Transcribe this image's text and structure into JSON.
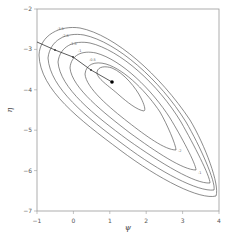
{
  "chart_data": {
    "type": "contour",
    "title": "",
    "xlabel": "ψ",
    "ylabel": "η",
    "xlim": [
      -1,
      4
    ],
    "ylim": [
      -7,
      -2
    ],
    "xticks": [
      -1,
      0,
      1,
      2,
      3,
      4
    ],
    "yticks": [
      -2,
      -3,
      -4,
      -5,
      -6,
      -7
    ],
    "grid": false,
    "legend": null,
    "contour_levels": [
      -3.5,
      -2.5,
      -1.5,
      -1,
      -0.5
    ],
    "contour_center": {
      "psi": 1.05,
      "eta": -3.9
    },
    "maximum_point": {
      "psi": 1.05,
      "eta": -3.9
    },
    "path_line": {
      "description": "curve from left axis to the maximum point",
      "points": [
        [
          -1,
          -2.82
        ],
        [
          -0.5,
          -3.0
        ],
        [
          0,
          -3.2
        ],
        [
          0.5,
          -3.55
        ],
        [
          1.05,
          -3.9
        ]
      ]
    },
    "colors": {
      "contour": "#555555",
      "point": "#000000",
      "axis": "#888888"
    }
  }
}
